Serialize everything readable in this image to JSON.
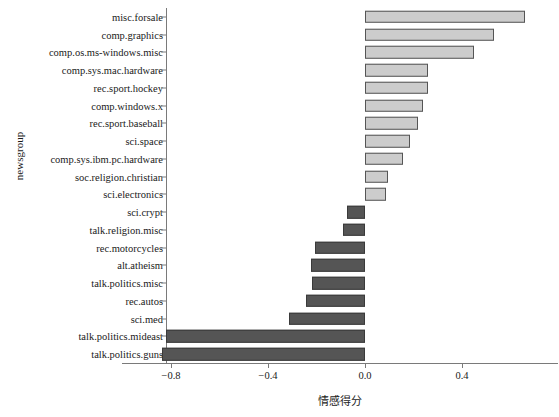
{
  "chart_data": {
    "type": "bar",
    "orientation": "horizontal",
    "title": "",
    "xlabel": "情感得分",
    "ylabel": "newsgroup",
    "xlim": [
      -0.92,
      0.72
    ],
    "xticks": [
      -0.8,
      -0.4,
      0.0,
      0.4
    ],
    "xtick_labels": [
      "−0.8",
      "−0.4",
      "0.0",
      "0.4"
    ],
    "grid": false,
    "legend": null,
    "colors": {
      "positive_fill": "#cccccc",
      "positive_edge": "#555555",
      "negative_fill": "#555555",
      "negative_edge": "#3a3a3a",
      "axis": "#7a7a7a",
      "text": "#1a1a1a",
      "background": "#ffffff"
    },
    "categories": [
      "misc.forsale",
      "comp.graphics",
      "comp.os.ms-windows.misc",
      "comp.sys.mac.hardware",
      "rec.sport.hockey",
      "comp.windows.x",
      "rec.sport.baseball",
      "sci.space",
      "comp.sys.ibm.pc.hardware",
      "soc.religion.christian",
      "sci.electronics",
      "sci.crypt",
      "talk.religion.misc",
      "rec.motorcycles",
      "alt.atheism",
      "talk.politics.misc",
      "rec.autos",
      "sci.med",
      "talk.politics.mideast",
      "talk.politics.guns"
    ],
    "values": [
      0.66,
      0.53,
      0.45,
      0.26,
      0.26,
      0.24,
      0.22,
      0.185,
      0.156,
      0.095,
      0.087,
      -0.074,
      -0.09,
      -0.206,
      -0.223,
      -0.219,
      -0.243,
      -0.313,
      -0.82,
      -0.837
    ]
  }
}
